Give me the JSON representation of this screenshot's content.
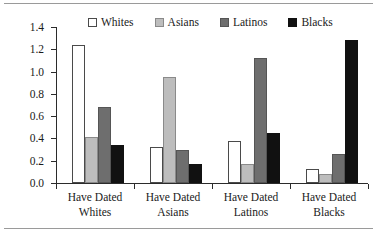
{
  "chart_data": {
    "type": "bar",
    "title": "",
    "subtitle": "",
    "xlabel": "",
    "ylabel": "Mean Level of Dating",
    "ylim": [
      0.0,
      1.4
    ],
    "yticks": [
      "0.0",
      "0.2",
      "0.4",
      "0.6",
      "0.8",
      "1.0",
      "1.2",
      "1.4"
    ],
    "ytick_values": [
      0.0,
      0.2,
      0.4,
      0.6,
      0.8,
      1.0,
      1.2,
      1.4
    ],
    "grid": false,
    "legend_position": "top",
    "categories": [
      "Have Dated Whites",
      "Have Dated Asians",
      "Have Dated Latinos",
      "Have Dated Blacks"
    ],
    "category_lines": [
      [
        "Have Dated",
        "Whites"
      ],
      [
        "Have Dated",
        "Asians"
      ],
      [
        "Have Dated",
        "Latinos"
      ],
      [
        "Have Dated",
        "Blacks"
      ]
    ],
    "series": [
      {
        "name": "Whites",
        "color": "#ffffff",
        "values": [
          1.24,
          0.32,
          0.38,
          0.13
        ]
      },
      {
        "name": "Asians",
        "color": "#bdbdbd",
        "values": [
          0.41,
          0.95,
          0.17,
          0.08
        ]
      },
      {
        "name": "Latinos",
        "color": "#6e6e6e",
        "values": [
          0.68,
          0.3,
          1.12,
          0.26
        ]
      },
      {
        "name": "Blacks",
        "color": "#111111",
        "values": [
          0.34,
          0.17,
          0.45,
          1.28
        ]
      }
    ]
  },
  "legend": {
    "items": [
      {
        "label": "Whites"
      },
      {
        "label": "Asians"
      },
      {
        "label": "Latinos"
      },
      {
        "label": "Blacks"
      }
    ]
  },
  "axes": {
    "y_title": "Mean Level of Dating",
    "y_ticks": [
      {
        "label": "1.4"
      },
      {
        "label": "1.2"
      },
      {
        "label": "1.0"
      },
      {
        "label": "0.8"
      },
      {
        "label": "0.6"
      },
      {
        "label": "0.4"
      },
      {
        "label": "0.2"
      },
      {
        "label": "0.0"
      }
    ]
  },
  "x_labels": [
    {
      "line1": "Have Dated",
      "line2": "Whites"
    },
    {
      "line1": "Have Dated",
      "line2": "Asians"
    },
    {
      "line1": "Have Dated",
      "line2": "Latinos"
    },
    {
      "line1": "Have Dated",
      "line2": "Blacks"
    }
  ]
}
